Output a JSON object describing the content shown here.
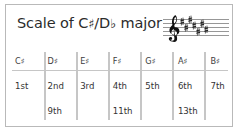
{
  "card": {
    "title_prefix": "Scale of ",
    "tonic_sharp": "C",
    "tonic_sharp_accidental": "♯",
    "separator": "/",
    "tonic_flat": "D",
    "tonic_flat_accidental": "♭",
    "title_suffix": " major",
    "full_title": "Scale of C♯/D♭ major",
    "border_color": "#b9b9b9",
    "background_color": "#ffffff",
    "text_color": "#2b2b2b",
    "grid_line_color": "#c6c6c6"
  },
  "staff": {
    "clef": "treble-clef",
    "clef_glyph": "𝄞",
    "line_count": 5,
    "key_signature_type": "sharps",
    "key_signature_count": 7,
    "accidental_glyph": "♯",
    "key_signature_notes": [
      "F♯",
      "C♯",
      "G♯",
      "D♯",
      "A♯",
      "E♯",
      "B♯"
    ],
    "staff_line_color": "#555555",
    "symbol_color": "#1a1a1a"
  },
  "table": {
    "column_count": 7,
    "notes": [
      {
        "letter": "C",
        "accidental": "♯",
        "label": "C♯"
      },
      {
        "letter": "D",
        "accidental": "♯",
        "label": "D♯"
      },
      {
        "letter": "E",
        "accidental": "♯",
        "label": "E♯"
      },
      {
        "letter": "F",
        "accidental": "♯",
        "label": "F♯"
      },
      {
        "letter": "G",
        "accidental": "♯",
        "label": "G♯"
      },
      {
        "letter": "A",
        "accidental": "♯",
        "label": "A♯"
      },
      {
        "letter": "B",
        "accidental": "♯",
        "label": "B♯"
      }
    ],
    "degrees": [
      "1st",
      "2nd",
      "3rd",
      "4th",
      "5th",
      "6th",
      "7th"
    ],
    "extended_degrees": [
      "",
      "9th",
      "",
      "11th",
      "",
      "13th",
      ""
    ]
  }
}
